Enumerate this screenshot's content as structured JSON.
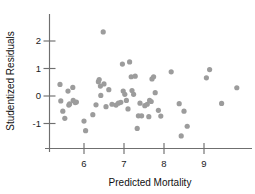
{
  "chart_data": {
    "type": "scatter",
    "title": "",
    "xlabel": "Predicted Mortality",
    "ylabel": "Studentized Residuals",
    "xlim": [
      5.28,
      10.1
    ],
    "ylim": [
      -1.95,
      2.8
    ],
    "xticks": [
      6,
      7,
      8,
      9
    ],
    "xticklabels": [
      "6",
      "7",
      "8",
      "9"
    ],
    "yticks": [
      2,
      1,
      0,
      -1
    ],
    "yticklabels": [
      "2",
      "1",
      "0",
      "-1"
    ],
    "grid": false,
    "legend": null,
    "marker": {
      "shape": "circle",
      "color": "#9c9c9c",
      "radius_px": 2.6
    },
    "series": [
      {
        "name": "Residuals",
        "color": "#9c9c9c",
        "points": [
          [
            5.4,
            0.42
          ],
          [
            5.42,
            -0.18
          ],
          [
            5.47,
            -0.55
          ],
          [
            5.52,
            -0.81
          ],
          [
            5.6,
            0.18
          ],
          [
            5.62,
            -0.33
          ],
          [
            5.64,
            -0.29
          ],
          [
            5.72,
            0.31
          ],
          [
            5.73,
            -0.16
          ],
          [
            5.78,
            -0.24
          ],
          [
            5.81,
            -0.22
          ],
          [
            6.0,
            -0.91
          ],
          [
            6.04,
            -1.26
          ],
          [
            6.22,
            -0.68
          ],
          [
            6.3,
            -0.32
          ],
          [
            6.36,
            0.52
          ],
          [
            6.38,
            0.6
          ],
          [
            6.41,
            0.36
          ],
          [
            6.42,
            0.02
          ],
          [
            6.48,
            2.33
          ],
          [
            6.5,
            0.44
          ],
          [
            6.55,
            -0.39
          ],
          [
            6.62,
            0.23
          ],
          [
            6.7,
            -0.3
          ],
          [
            6.8,
            -0.33
          ],
          [
            6.86,
            -0.26
          ],
          [
            6.92,
            -0.23
          ],
          [
            6.96,
            1.16
          ],
          [
            6.98,
            0.18
          ],
          [
            7.02,
            0.06
          ],
          [
            7.06,
            -0.16
          ],
          [
            7.1,
            -0.47
          ],
          [
            7.14,
            1.24
          ],
          [
            7.18,
            0.7
          ],
          [
            7.2,
            0.2
          ],
          [
            7.24,
            0.06
          ],
          [
            7.28,
            0.72
          ],
          [
            7.33,
            -1.18
          ],
          [
            7.36,
            -0.72
          ],
          [
            7.4,
            -0.26
          ],
          [
            7.44,
            -0.72
          ],
          [
            7.52,
            -0.35
          ],
          [
            7.58,
            -0.3
          ],
          [
            7.62,
            -0.75
          ],
          [
            7.64,
            -0.16
          ],
          [
            7.68,
            -0.2
          ],
          [
            7.7,
            0.62
          ],
          [
            7.74,
            0.7
          ],
          [
            7.78,
            0.12
          ],
          [
            7.86,
            -0.52
          ],
          [
            7.92,
            -0.73
          ],
          [
            8.18,
            0.88
          ],
          [
            8.38,
            -0.28
          ],
          [
            8.43,
            -1.45
          ],
          [
            8.5,
            -0.55
          ],
          [
            8.58,
            -1.1
          ],
          [
            9.06,
            0.66
          ],
          [
            9.14,
            0.96
          ],
          [
            9.44,
            -0.27
          ],
          [
            9.82,
            0.3
          ]
        ]
      }
    ]
  },
  "figure": {
    "xlabel": "Predicted Mortality",
    "ylabel": "Studentized Residuals"
  }
}
